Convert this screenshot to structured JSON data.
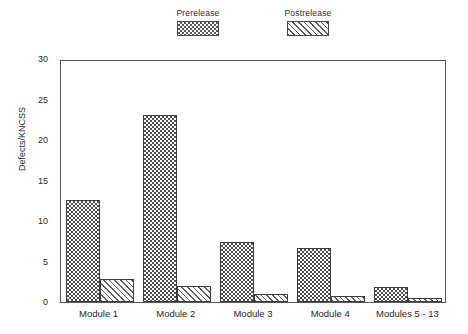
{
  "chart_data": {
    "type": "bar",
    "title": "",
    "xlabel": "",
    "ylabel": "Defects/KNCSS",
    "ylim": [
      0,
      30
    ],
    "yticks": [
      0,
      5,
      10,
      15,
      20,
      25,
      30
    ],
    "grid": false,
    "legend_position": "top-center",
    "categories": [
      "Module 1",
      "Module 2",
      "Module 3",
      "Module 4",
      "Modules 5 - 13"
    ],
    "series": [
      {
        "name": "Prerelease",
        "values": [
          12.6,
          23.1,
          7.4,
          6.7,
          1.8
        ],
        "pattern": "checkerboard-dark"
      },
      {
        "name": "Postrelease",
        "values": [
          2.9,
          2.0,
          1.0,
          0.8,
          0.5
        ],
        "pattern": "diagonal-hatch-light"
      }
    ]
  },
  "legend": {
    "entries": [
      {
        "label": "Prerelease"
      },
      {
        "label": "Postrelease"
      }
    ]
  },
  "axes": {
    "y_title": "Defects/KNCSS",
    "y_tick_labels": [
      "30",
      "25",
      "20",
      "15",
      "10",
      "5",
      "0"
    ],
    "x_tick_labels": [
      "Module 1",
      "Module 2",
      "Module 3",
      "Module 4",
      "Modules 5 - 13"
    ]
  },
  "colors": {
    "frame": "#555555",
    "prerelease_fill": "#4d4d4d",
    "postrelease_fill": "#616161",
    "background": "#ffffff",
    "text": "#1f1f1f"
  }
}
